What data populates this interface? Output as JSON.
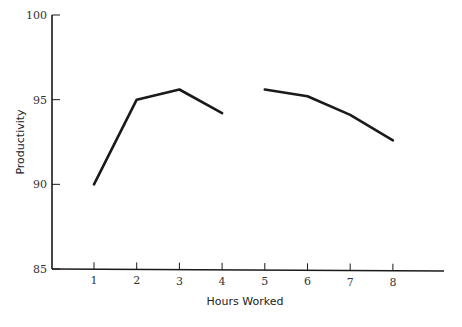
{
  "chart_data": {
    "type": "line",
    "title": "",
    "xlabel": "Hours Worked",
    "ylabel": "Productivity",
    "x": [
      1,
      2,
      3,
      4,
      5,
      6,
      7,
      8
    ],
    "xticks": [
      "1",
      "2",
      "3",
      "4",
      "5",
      "6",
      "7",
      "8"
    ],
    "yticks": [
      "85",
      "90",
      "95",
      "100"
    ],
    "ylim": [
      85,
      100
    ],
    "xlim": [
      0,
      9
    ],
    "grid": false,
    "legend": null,
    "series": [
      {
        "name": "Productivity",
        "segments": [
          {
            "x": [
              1,
              2,
              3,
              4
            ],
            "values": [
              90.0,
              95.0,
              95.6,
              94.2
            ]
          },
          {
            "x": [
              5,
              6,
              7,
              8
            ],
            "values": [
              95.6,
              95.2,
              94.1,
              92.6
            ]
          }
        ],
        "color": "#1a1a1a"
      }
    ]
  }
}
